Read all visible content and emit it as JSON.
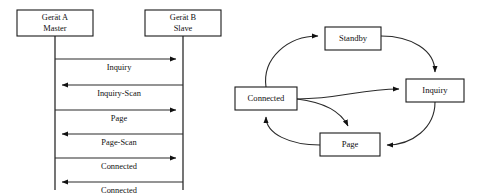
{
  "figure": {
    "background_color": "#ffffff",
    "line_color": "#2a2a2a",
    "box_border_color": "#1a1a1a",
    "text_color": "#111111"
  },
  "sequence_diagram": {
    "name": "bluetooth-connection-sequence",
    "participants": [
      {
        "id": "device-a",
        "line1": "Gerät A",
        "line2": "Master",
        "x": 55
      },
      {
        "id": "device-b",
        "line1": "Gerät B",
        "line2": "Slave",
        "x": 183
      }
    ],
    "messages": [
      {
        "label": "Inquiry",
        "direction": "right",
        "y": 59
      },
      {
        "label": "Inquiry-Scan",
        "direction": "left",
        "y": 85
      },
      {
        "label": "Page",
        "direction": "right",
        "y": 110
      },
      {
        "label": "Page-Scan",
        "direction": "left",
        "y": 134
      },
      {
        "label": "Connected",
        "direction": "right",
        "y": 158
      },
      {
        "label": "Connected",
        "direction": "left",
        "y": 182
      }
    ]
  },
  "state_diagram": {
    "name": "bluetooth-state-machine",
    "states": [
      {
        "id": "standby",
        "label": "Standby",
        "x": 325,
        "y": 27,
        "w": 56,
        "h": 23
      },
      {
        "id": "inquiry",
        "label": "Inquiry",
        "x": 406,
        "y": 79,
        "w": 58,
        "h": 23
      },
      {
        "id": "connected",
        "label": "Connected",
        "x": 235,
        "y": 87,
        "w": 62,
        "h": 23
      },
      {
        "id": "page",
        "label": "Page",
        "x": 320,
        "y": 133,
        "w": 60,
        "h": 23
      }
    ],
    "transitions": [
      {
        "from": "connected",
        "to": "standby"
      },
      {
        "from": "standby",
        "to": "inquiry"
      },
      {
        "from": "inquiry",
        "to": "page"
      },
      {
        "from": "page",
        "to": "connected"
      },
      {
        "from": "connected",
        "to": "inquiry"
      },
      {
        "from": "connected",
        "to": "page"
      }
    ]
  }
}
